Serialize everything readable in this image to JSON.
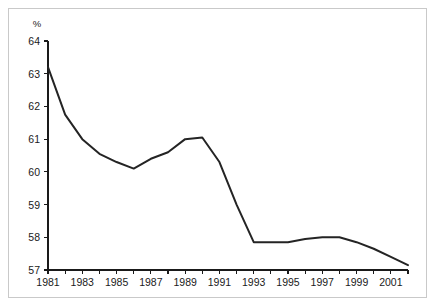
{
  "chart_data": {
    "type": "line",
    "title": "",
    "subtitle": "",
    "xlabel": "",
    "ylabel": "%",
    "unit_label": "%",
    "xlim": [
      1981,
      2002
    ],
    "ylim": [
      57,
      64
    ],
    "grid": false,
    "legend": null,
    "y_ticks": [
      57,
      58,
      59,
      60,
      61,
      62,
      63,
      64
    ],
    "y_tick_labels": [
      "57",
      "58",
      "59",
      "60",
      "61",
      "62",
      "63",
      "64"
    ],
    "x_ticks": [
      1981,
      1982,
      1983,
      1984,
      1985,
      1986,
      1987,
      1988,
      1989,
      1990,
      1991,
      1992,
      1993,
      1994,
      1995,
      1996,
      1997,
      1998,
      1999,
      2000,
      2001,
      2002
    ],
    "x_tick_labels": [
      "1981",
      "",
      "1983",
      "",
      "1985",
      "",
      "1987",
      "",
      "1989",
      "",
      "1991",
      "",
      "1993",
      "",
      "1995",
      "",
      "1997",
      "",
      "1999",
      "",
      "2001",
      ""
    ],
    "x_labeled_ticks": [
      "1981",
      "1983",
      "1985",
      "1987",
      "1989",
      "1991",
      "1993",
      "1995",
      "1997",
      "1999",
      "2001"
    ],
    "series": [
      {
        "name": "",
        "color": "#242424",
        "x": [
          1981,
          1982,
          1983,
          1984,
          1985,
          1986,
          1987,
          1988,
          1989,
          1990,
          1991,
          1992,
          1993,
          1994,
          1995,
          1996,
          1997,
          1998,
          1999,
          2000,
          2001,
          2002
        ],
        "values": [
          63.2,
          61.75,
          61.0,
          60.55,
          60.3,
          60.1,
          60.4,
          60.6,
          61.0,
          61.05,
          60.3,
          59.0,
          57.85,
          57.85,
          57.85,
          57.95,
          58.0,
          58.0,
          57.85,
          57.65,
          57.4,
          57.15
        ]
      }
    ]
  },
  "axes": {
    "unit_label": "%"
  }
}
